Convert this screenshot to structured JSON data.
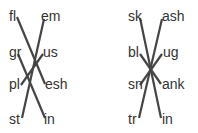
{
  "diagrams": [
    {
      "left_column": [
        "fl",
        "gr",
        "pl",
        "st"
      ],
      "right_column": [
        "em",
        "us",
        "esh",
        "in"
      ],
      "matches": [
        {
          "from": "fl",
          "to": "esh"
        },
        {
          "from": "gr",
          "to": "in"
        },
        {
          "from": "pl",
          "to": "us"
        },
        {
          "from": "st",
          "to": "em"
        }
      ]
    },
    {
      "left_column": [
        "sk",
        "bl",
        "sn",
        "tr"
      ],
      "right_column": [
        "ash",
        "ug",
        "ank",
        "in"
      ],
      "matches": [
        {
          "from": "sk",
          "to": "in"
        },
        {
          "from": "bl",
          "to": "ank"
        },
        {
          "from": "sn",
          "to": "ug"
        },
        {
          "from": "tr",
          "to": "ash"
        }
      ]
    }
  ],
  "colors": {
    "line": "#454545",
    "text": "#333333",
    "background": "#ffffff"
  }
}
